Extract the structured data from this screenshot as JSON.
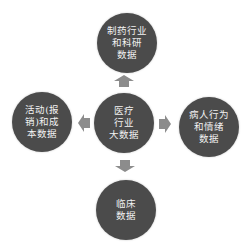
{
  "diagram": {
    "center": {
      "lines": [
        "医疗",
        "行业",
        "大数据"
      ]
    },
    "top": {
      "lines": [
        "制药行业",
        "和科研",
        "数据"
      ]
    },
    "left": {
      "lines": [
        "活动(报",
        "销)和成",
        "本数据"
      ]
    },
    "right": {
      "lines": [
        "病人行为",
        "和情绪",
        "数据"
      ]
    },
    "bottom": {
      "lines": [
        "临床",
        "数据"
      ]
    },
    "colors": {
      "node_fill": "#4b4b4b",
      "node_text": "#f2f2f2",
      "arrow_fill": "#8c8c8c",
      "background": "#ffffff"
    },
    "arrows": [
      {
        "from": "center",
        "to": "top",
        "direction": "up"
      },
      {
        "from": "center",
        "to": "left",
        "direction": "left"
      },
      {
        "from": "center",
        "to": "right",
        "direction": "right"
      },
      {
        "from": "center",
        "to": "bottom",
        "direction": "down"
      }
    ]
  }
}
